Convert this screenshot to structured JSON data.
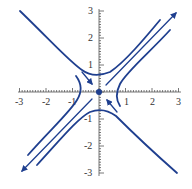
{
  "chart_data": {
    "type": "line",
    "title": "",
    "subtitle": "phase portrait (saddle point)",
    "xlabel": "",
    "ylabel": "",
    "xlim": [
      -3,
      3
    ],
    "ylim": [
      -3,
      3
    ],
    "grid": false,
    "legend": "none",
    "x_tick_labels": [
      "-3",
      "-2",
      "-1",
      "1",
      "2",
      "3"
    ],
    "y_tick_labels": [
      "3",
      "2",
      "1",
      "-1",
      "-2",
      "-3"
    ],
    "equilibrium": {
      "x": 0,
      "y": 0,
      "type": "saddle"
    },
    "series": [
      {
        "name": "stable-manifold",
        "description": "line y = -x, arrows toward origin"
      },
      {
        "name": "unstable-manifold",
        "description": "line y = x, arrows away from origin"
      },
      {
        "name": "hyperbola-top",
        "description": "y^2 - x^2 = c, upper branch, vertex near (0,0.6)"
      },
      {
        "name": "hyperbola-bottom",
        "description": "y^2 - x^2 = c, lower branch, vertex near (0,-0.6)"
      },
      {
        "name": "hyperbola-left",
        "description": "x^2 - y^2 = c, left branch, vertex near (-0.6,0)"
      },
      {
        "name": "hyperbola-right",
        "description": "x^2 - y^2 = c, right branch, vertex near (0.6,0)"
      }
    ]
  },
  "colors": {
    "curve": "#1f3f8f",
    "axis": "#444444"
  }
}
